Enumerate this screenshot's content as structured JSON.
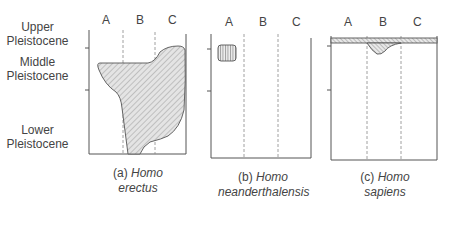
{
  "diagram": {
    "y_axis_labels": [
      {
        "line1": "Upper",
        "line2": "Pleistocene"
      },
      {
        "line1": "Middle",
        "line2": "Pleistocene"
      },
      {
        "line1": "Lower",
        "line2": "Pleistocene"
      }
    ],
    "panels": [
      {
        "id": "a",
        "columns": [
          "A",
          "B",
          "C"
        ],
        "caption_prefix": "(a)",
        "caption_genus": "Homo",
        "caption_species": "erectus"
      },
      {
        "id": "b",
        "columns": [
          "A",
          "B",
          "C"
        ],
        "caption_prefix": "(b)",
        "caption_genus": "Homo",
        "caption_species": "neanderthalensis"
      },
      {
        "id": "c",
        "columns": [
          "A",
          "B",
          "C"
        ],
        "caption_prefix": "(c)",
        "caption_genus": "Homo",
        "caption_species": "sapiens"
      }
    ]
  }
}
